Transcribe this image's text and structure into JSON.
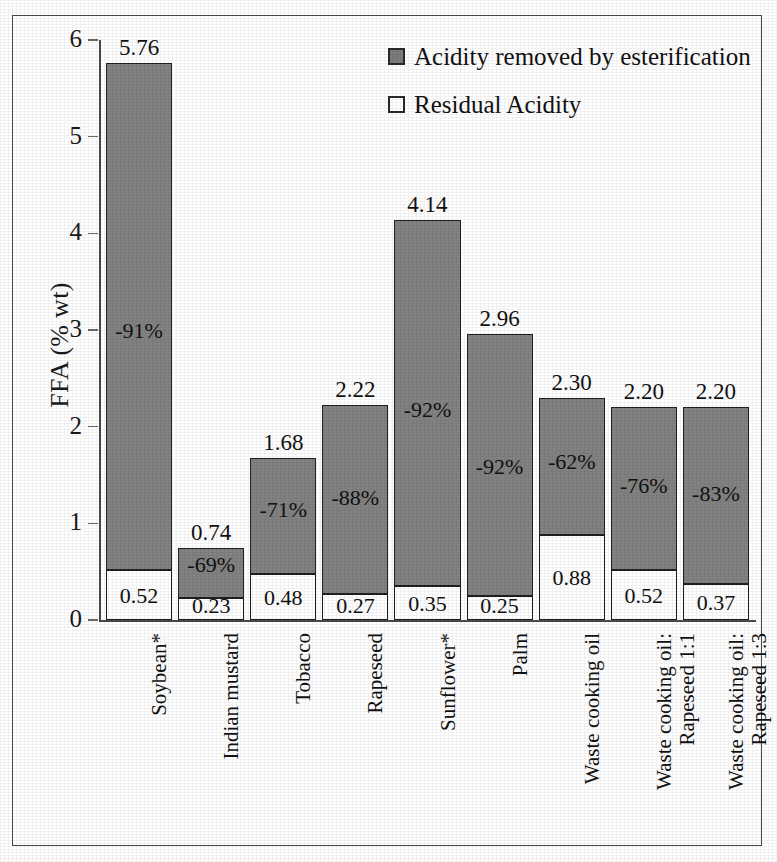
{
  "chart_data": {
    "type": "bar",
    "subtype": "stacked-bar",
    "title": "",
    "xlabel": "",
    "ylabel": "FFA (% wt)",
    "ylim": [
      0,
      6
    ],
    "ytick_labels": [
      "6",
      "5",
      "4",
      "3",
      "2",
      "1",
      "0"
    ],
    "yticks": [
      6,
      5,
      4,
      3,
      2,
      1,
      0
    ],
    "grid": false,
    "legend_position": "top-right",
    "categories": [
      "Soybean*",
      "Indian mustard",
      "Tobacco",
      "Rapeseed",
      "Sunflower*",
      "Palm",
      "Waste cooking oil",
      "Waste cooking oil:\nRapeseed 1:1",
      "Waste cooking oil:\nRapeseed 1:3"
    ],
    "series": [
      {
        "name": "Acidity removed by esterification",
        "color": "#828282",
        "values": [
          5.24,
          0.51,
          1.2,
          1.95,
          3.79,
          2.71,
          1.42,
          1.68,
          1.83
        ]
      },
      {
        "name": "Residual Acidity",
        "color": "#ffffff",
        "values": [
          0.52,
          0.23,
          0.48,
          0.27,
          0.35,
          0.25,
          0.88,
          0.52,
          0.37
        ]
      }
    ],
    "totals": [
      5.76,
      0.74,
      1.68,
      2.22,
      4.14,
      2.96,
      2.3,
      2.2,
      2.2
    ],
    "total_labels": [
      "5.76",
      "0.74",
      "1.68",
      "2.22",
      "4.14",
      "2.96",
      "2.30",
      "2.20",
      "2.20"
    ],
    "residual_labels": [
      "0.52",
      "0.23",
      "0.48",
      "0.27",
      "0.35",
      "0.25",
      "0.88",
      "0.52",
      "0.37"
    ],
    "reduction_labels": [
      "-91%",
      "-69%",
      "-71%",
      "-88%",
      "-92%",
      "-92%",
      "-62%",
      "-76%",
      "-83%"
    ],
    "reduction_values": [
      -91,
      -69,
      -71,
      -88,
      -92,
      -92,
      -62,
      -76,
      -83
    ]
  },
  "axes": {
    "y_title": "FFA (% wt)",
    "y_ticks": [
      {
        "label": "6",
        "value": 6
      },
      {
        "label": "5",
        "value": 5
      },
      {
        "label": "4",
        "value": 4
      },
      {
        "label": "3",
        "value": 3
      },
      {
        "label": "2",
        "value": 2
      },
      {
        "label": "1",
        "value": 1
      },
      {
        "label": "0",
        "value": 0
      }
    ]
  },
  "legend": {
    "items": [
      {
        "label": "Acidity removed by esterification",
        "swatch": "filled-gray-square"
      },
      {
        "label": "Residual Acidity",
        "swatch": "outlined-white-square"
      }
    ]
  },
  "colors": {
    "bar_removed": "#828282",
    "bar_residual": "#ffffff",
    "bar_outline": "#1f1f1f",
    "axis": "#4a4a4a",
    "text": "#111111"
  }
}
